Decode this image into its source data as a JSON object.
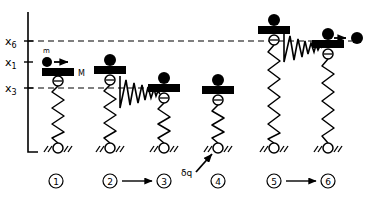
{
  "figure": {
    "type": "physics-diagram",
    "title_text": "",
    "background_color": "#ffffff",
    "ink_color": "#000000"
  },
  "axis": {
    "name": "vertical-position-axis",
    "orientation": "vertical",
    "ticks": [
      {
        "id": "x6",
        "label_base": "x",
        "label_sub": "6",
        "y": 41
      },
      {
        "id": "x1",
        "label_base": "x",
        "label_sub": "1",
        "y": 62
      },
      {
        "id": "x3",
        "label_base": "x",
        "label_sub": "3",
        "y": 88
      }
    ],
    "x": 28,
    "y_top": 12,
    "y_bottom": 152
  },
  "reference_lines": [
    {
      "id": "x6-line",
      "label": "x6",
      "y": 41,
      "x_start": 28,
      "x_end": 352,
      "style": "dashed"
    },
    {
      "id": "x3-line",
      "label": "x3",
      "y": 88,
      "x_start": 28,
      "x_end": 160,
      "style": "dashed"
    }
  ],
  "labels": {
    "small_mass": "m",
    "big_mass": "M",
    "heat_input": "δq",
    "state_word": "State"
  },
  "states": [
    {
      "number": "1",
      "circle_label": "①",
      "cx": 56,
      "block_y": 72,
      "spring_top": 80,
      "ground_y": 148,
      "label_x": 56,
      "has_incoming_mass": true,
      "has_ejected_mass": false,
      "has_wedge": false,
      "mass_on_top": false,
      "block_label": "M"
    },
    {
      "number": "2",
      "circle_label": "②",
      "cx": 110,
      "block_y": 72,
      "spring_top": 80,
      "ground_y": 148,
      "has_incoming_mass": false,
      "has_ejected_mass": false,
      "has_wedge": true,
      "mass_on_top": true
    },
    {
      "number": "3",
      "circle_label": "③",
      "cx": 164,
      "block_y": 90,
      "spring_top": 98,
      "ground_y": 148,
      "has_incoming_mass": false,
      "has_ejected_mass": false,
      "has_wedge": false,
      "mass_on_top": true
    },
    {
      "number": "4",
      "circle_label": "④",
      "cx": 218,
      "block_y": 92,
      "spring_top": 100,
      "ground_y": 148,
      "has_incoming_mass": false,
      "has_ejected_mass": false,
      "has_wedge": false,
      "mass_on_top": true,
      "heat_annotation": true
    },
    {
      "number": "5",
      "circle_label": "⑤",
      "cx": 274,
      "block_y": 32,
      "spring_top": 40,
      "ground_y": 148,
      "has_incoming_mass": false,
      "has_ejected_mass": false,
      "has_wedge": true,
      "mass_on_top": true
    },
    {
      "number": "6",
      "circle_label": "⑥",
      "cx": 328,
      "block_y": 46,
      "spring_top": 54,
      "ground_y": 148,
      "has_incoming_mass": false,
      "has_ejected_mass": true,
      "has_wedge": false,
      "mass_on_top": true
    }
  ],
  "transitions": [
    {
      "from": "2",
      "to": "3",
      "arrow": true,
      "x_start": 124,
      "x_end": 152,
      "y": 181
    },
    {
      "from": "5",
      "to": "6",
      "arrow": true,
      "x_start": 288,
      "x_end": 316,
      "y": 181
    }
  ],
  "bottom_row": {
    "state_word_x": 14,
    "state_word_y": 184,
    "items": [
      {
        "number": "1",
        "glyph": "①",
        "x": 56
      },
      {
        "number": "2",
        "glyph": "②",
        "x": 110
      },
      {
        "number": "3",
        "glyph": "③",
        "x": 164
      },
      {
        "number": "4",
        "glyph": "④",
        "x": 218
      },
      {
        "number": "5",
        "glyph": "⑤",
        "x": 274
      },
      {
        "number": "6",
        "glyph": "⑥",
        "x": 328
      }
    ]
  }
}
